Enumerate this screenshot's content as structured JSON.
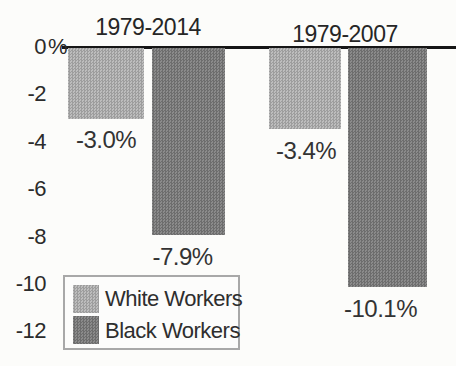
{
  "chart_data": {
    "type": "bar",
    "title": "",
    "categories": [
      "1979-2014",
      "1979-2007"
    ],
    "series": [
      {
        "name": "White Workers",
        "values": [
          -3.0,
          -3.4
        ],
        "labels": [
          "-3.0%",
          "-3.4%"
        ],
        "color": "#adadad"
      },
      {
        "name": "Black Workers",
        "values": [
          -7.9,
          -10.1
        ],
        "labels": [
          "-7.9%",
          "-10.1%"
        ],
        "color": "#7c7c7c"
      }
    ],
    "y_axis": {
      "ticks": [
        {
          "text": "0",
          "suffix": "%",
          "value": 0
        },
        {
          "text": "-2",
          "value": -2
        },
        {
          "text": "-4",
          "value": -4
        },
        {
          "text": "-6",
          "value": -6
        },
        {
          "text": "-8",
          "value": -8
        },
        {
          "text": "-10",
          "value": -10
        },
        {
          "text": "-12",
          "value": -12
        }
      ],
      "range": [
        -13,
        0
      ]
    },
    "legend": {
      "position": "bottom-left",
      "items": [
        {
          "label": "White Workers",
          "color": "#adadad"
        },
        {
          "label": "Black Workers",
          "color": "#7c7c7c"
        }
      ]
    },
    "colors": {
      "baseline": "#161616",
      "background": "#fcfcfa"
    },
    "grid": false
  }
}
